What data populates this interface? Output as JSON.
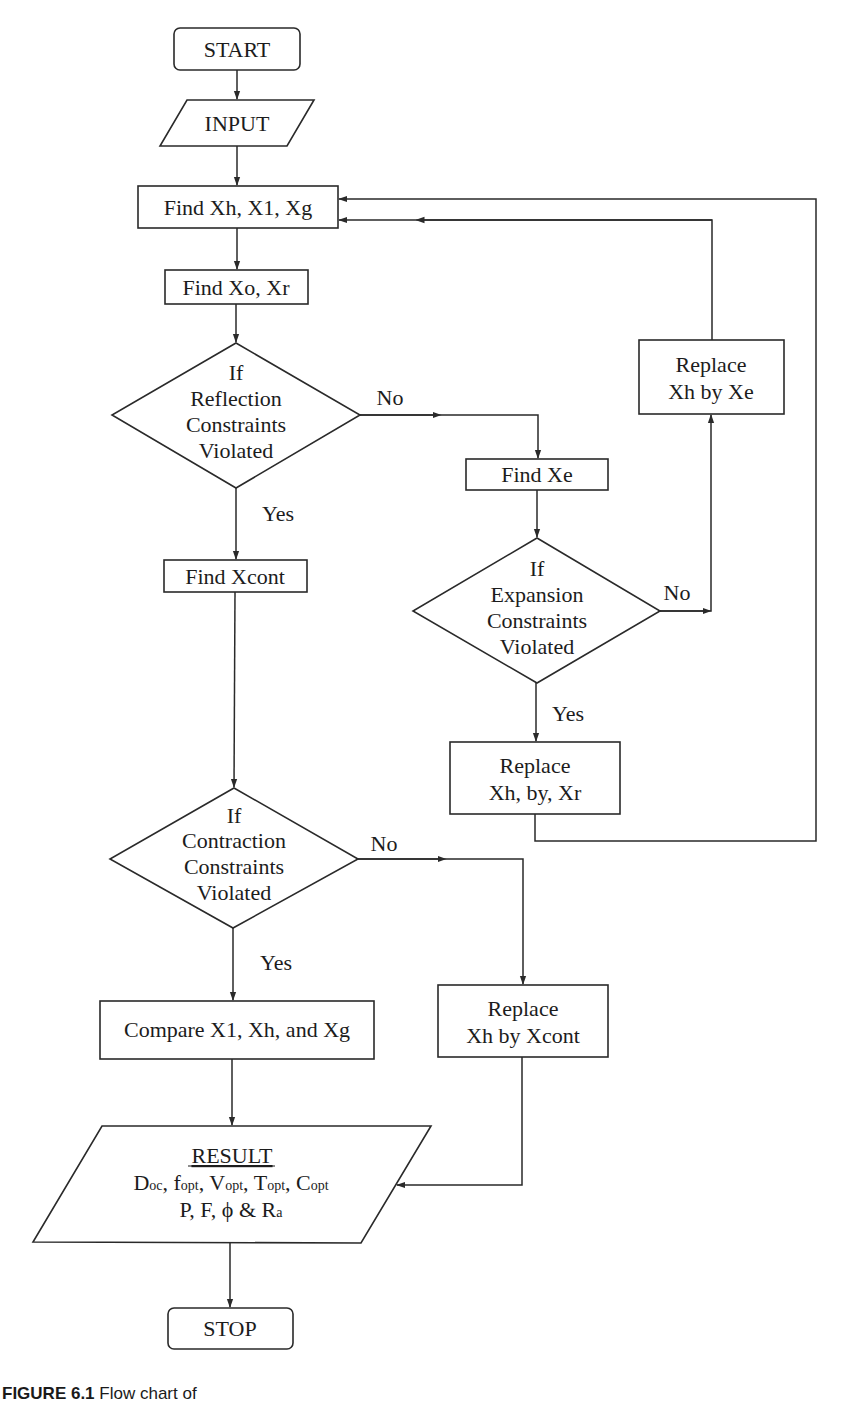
{
  "diagram": {
    "type": "flowchart",
    "nodes": {
      "start": {
        "shape": "terminator",
        "label": "START"
      },
      "input": {
        "shape": "parallelogram",
        "label": "INPUT"
      },
      "find_xh": {
        "shape": "process",
        "label": "Find Xh, X1, Xg"
      },
      "find_xo": {
        "shape": "process",
        "label": "Find Xo, Xr"
      },
      "reflection": {
        "shape": "decision",
        "lines": [
          "If",
          "Reflection",
          "Constraints",
          "Violated"
        ]
      },
      "find_xe": {
        "shape": "process",
        "label": "Find Xe"
      },
      "replace_xe": {
        "shape": "process",
        "lines": [
          "Replace",
          "Xh by Xe"
        ]
      },
      "expansion": {
        "shape": "decision",
        "lines": [
          "If",
          "Expansion",
          "Constraints",
          "Violated"
        ]
      },
      "replace_xr": {
        "shape": "process",
        "lines": [
          "Replace",
          "Xh, by, Xr"
        ]
      },
      "find_xcont": {
        "shape": "process",
        "label": "Find Xcont"
      },
      "contraction": {
        "shape": "decision",
        "lines": [
          "If",
          "Contraction",
          "Constraints",
          "Violated"
        ]
      },
      "compare": {
        "shape": "process",
        "label": "Compare X1, Xh, and Xg"
      },
      "replace_xcont": {
        "shape": "process",
        "lines": [
          "Replace",
          "Xh by Xcont"
        ]
      },
      "result": {
        "shape": "parallelogram",
        "title": "RESULT",
        "line1": [
          {
            "base": "D",
            "sub": "oc",
            "sep": ", "
          },
          {
            "base": "f",
            "sub": "opt",
            "sep": ", "
          },
          {
            "base": "V",
            "sub": "opt",
            "sep": ", "
          },
          {
            "base": "T",
            "sub": "opt",
            "sep": ", "
          },
          {
            "base": "C",
            "sub": "opt",
            "sep": ""
          }
        ],
        "line2_prefix": "P, F, ϕ & R",
        "line2_sub": "a"
      },
      "stop": {
        "shape": "terminator",
        "label": "STOP"
      }
    },
    "edge_labels": {
      "reflection_no": "No",
      "reflection_yes": "Yes",
      "expansion_no": "No",
      "expansion_yes": "Yes",
      "contraction_no": "No",
      "contraction_yes": "Yes"
    },
    "edges": [
      [
        "start",
        "input"
      ],
      [
        "input",
        "find_xh"
      ],
      [
        "find_xh",
        "find_xo"
      ],
      [
        "find_xo",
        "reflection"
      ],
      [
        "reflection",
        "find_xe",
        "No"
      ],
      [
        "reflection",
        "find_xcont",
        "Yes"
      ],
      [
        "find_xe",
        "expansion"
      ],
      [
        "expansion",
        "replace_xe",
        "No"
      ],
      [
        "expansion",
        "replace_xr",
        "Yes"
      ],
      [
        "replace_xe",
        "find_xh"
      ],
      [
        "replace_xr",
        "find_xh"
      ],
      [
        "find_xcont",
        "contraction"
      ],
      [
        "contraction",
        "replace_xcont",
        "No"
      ],
      [
        "contraction",
        "compare",
        "Yes"
      ],
      [
        "compare",
        "result"
      ],
      [
        "replace_xcont",
        "result"
      ],
      [
        "result",
        "stop"
      ]
    ]
  },
  "caption": {
    "figure": "FIGURE 6.1",
    "text": "Flow chart of"
  }
}
